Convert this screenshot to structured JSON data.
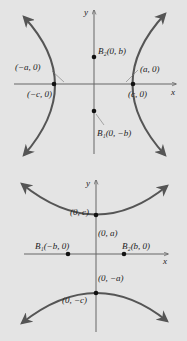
{
  "colors": {
    "background": "#e4e4e4",
    "curve": "#555555",
    "axis": "#666666",
    "point": "#111111",
    "text": "#222222"
  },
  "diagram_top": {
    "description": "Hyperbola with horizontal transverse axis",
    "axis_x_label": "x",
    "axis_y_label": "y",
    "points": [
      {
        "name": "B2",
        "label": "B₂(0, b)"
      },
      {
        "name": "-a",
        "label": "(−a, 0)"
      },
      {
        "name": "a",
        "label": "(a, 0)"
      },
      {
        "name": "-c",
        "label": "(−c, 0)"
      },
      {
        "name": "c",
        "label": "(c, 0)"
      },
      {
        "name": "B1",
        "label": "B₁(0, −b)"
      }
    ]
  },
  "diagram_bottom": {
    "description": "Hyperbola with vertical transverse axis",
    "axis_x_label": "x",
    "axis_y_label": "y",
    "points": [
      {
        "name": "c",
        "label": "(0, c)"
      },
      {
        "name": "a",
        "label": "(0, a)"
      },
      {
        "name": "B1",
        "label": "B₁(−b, 0)"
      },
      {
        "name": "B2",
        "label": "B₂(b, 0)"
      },
      {
        "name": "-a",
        "label": "(0, −a)"
      },
      {
        "name": "-c",
        "label": "(0, −c)"
      }
    ]
  }
}
